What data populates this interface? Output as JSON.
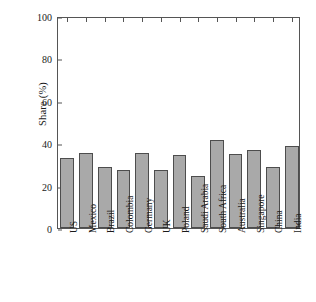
{
  "chart_data": {
    "type": "bar",
    "title": "",
    "subtitle": "",
    "xlabel": "",
    "ylabel": "Share (%)",
    "ylim": [
      0,
      100
    ],
    "yticks": [
      0,
      20,
      40,
      60,
      80,
      100
    ],
    "ytick_labels": [
      "0",
      "20",
      "40",
      "60",
      "80",
      "100"
    ],
    "grid": false,
    "legend": null,
    "bar_color": "#a9a9a9",
    "bar_edge_color": "#4d4d4d",
    "categories": [
      "US",
      "Mexico",
      "Brazil",
      "Colombia",
      "Germany",
      "UK",
      "Poland",
      "Saudi Arabia",
      "South Africa",
      "Australia",
      "Singapore",
      "China",
      "India"
    ],
    "values": [
      33,
      35.5,
      29,
      27.5,
      35.5,
      27.5,
      34.5,
      24.5,
      41.5,
      35,
      37,
      29,
      38.5
    ]
  }
}
